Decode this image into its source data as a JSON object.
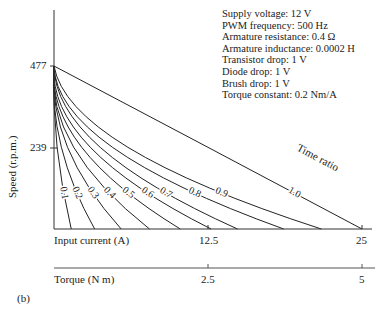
{
  "parameters": [
    "Supply voltage: 12 V",
    "PWM frequency: 500 Hz",
    "Armature resistance: 0.4 Ω",
    "Armature inductance: 0.0002 H",
    "Transistor drop: 1 V",
    "Diode drop: 1 V",
    "Brush drop: 1 V",
    "Torque constant: 0.2 Nm/A"
  ],
  "labels": {
    "ylabel": "Speed (r.p.m.)",
    "xlabel": "Input current (A)",
    "x2label": "Torque (N m)",
    "series_label": "Time ratio",
    "panel": "(b)",
    "ytick_477": "477",
    "ytick_239": "239",
    "xtick_12_5": "12.5",
    "xtick_25": "25",
    "x2tick_2_5": "2.5",
    "x2tick_5": "5"
  },
  "chart_data": {
    "type": "line",
    "title": "",
    "xlabel": "Input current (A)",
    "x2label": "Torque (N m)",
    "ylabel": "Speed (r.p.m.)",
    "xlim": [
      0,
      25
    ],
    "ylim": [
      0,
      477
    ],
    "xticks": [
      12.5,
      25
    ],
    "x2ticks": [
      2.5,
      5
    ],
    "yticks": [
      239,
      477
    ],
    "legend_title": "Time ratio",
    "grid": false,
    "series": [
      {
        "name": "0.1",
        "x_end": 2.8,
        "points": [
          [
            0,
            477
          ],
          [
            0.5,
            239
          ],
          [
            2.8,
            0
          ]
        ]
      },
      {
        "name": "0.2",
        "x_end": 6.6,
        "points": [
          [
            0,
            477
          ],
          [
            1.2,
            239
          ],
          [
            6.6,
            0
          ]
        ]
      },
      {
        "name": "0.3",
        "x_end": 10.9,
        "points": [
          [
            0,
            477
          ],
          [
            2.2,
            239
          ],
          [
            10.9,
            0
          ]
        ]
      },
      {
        "name": "0.4",
        "x_end": 15.5,
        "points": [
          [
            0,
            477
          ],
          [
            3.2,
            239
          ],
          [
            15.5,
            0
          ]
        ]
      },
      {
        "name": "0.5",
        "x_end": 20.5,
        "points": [
          [
            0,
            477
          ],
          [
            4.5,
            239
          ],
          [
            20.5,
            0
          ]
        ]
      },
      {
        "name": "0.6",
        "x_end": 25.5,
        "points": [
          [
            0,
            477
          ],
          [
            5.9,
            239
          ],
          [
            25.5,
            0
          ]
        ]
      },
      {
        "name": "0.7",
        "x_end": 29.8,
        "points": [
          [
            0,
            477
          ],
          [
            7.5,
            239
          ],
          [
            29.8,
            0
          ]
        ]
      },
      {
        "name": "0.8",
        "x_end": 37.3,
        "points": [
          [
            0,
            477
          ],
          [
            9.5,
            239
          ],
          [
            37.3,
            0
          ]
        ]
      },
      {
        "name": "0.9",
        "x_end": 43.4,
        "points": [
          [
            0,
            477
          ],
          [
            12.0,
            239
          ],
          [
            43.4,
            0
          ]
        ]
      },
      {
        "name": "1.0",
        "x_end": 50.0,
        "points": [
          [
            0,
            477
          ],
          [
            25.0,
            239
          ],
          [
            50.0,
            0
          ]
        ]
      }
    ]
  }
}
